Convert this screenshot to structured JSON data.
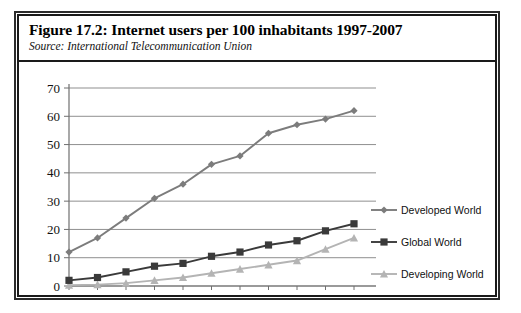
{
  "figure": {
    "title": "Figure 17.2:  Internet users per 100 inhabitants 1997-2007",
    "source": "Source:  International Telecommunication Union"
  },
  "chart_data": {
    "type": "line",
    "title": "Internet users per 100 inhabitants 1997-2007",
    "subtitle": "Source: International Telecommunication Union",
    "xlabel": "",
    "ylabel": "",
    "x": [
      1997,
      1998,
      1999,
      2000,
      2001,
      2002,
      2003,
      2004,
      2005,
      2006,
      2007
    ],
    "xtick_labels": [
      "1997",
      "",
      "1999",
      "",
      "2001",
      "",
      "2003",
      "",
      "2005",
      "",
      "2007"
    ],
    "xlim": [
      1997,
      2007
    ],
    "ylim": [
      0,
      70
    ],
    "yticks": [
      0,
      10,
      20,
      30,
      40,
      50,
      60,
      70
    ],
    "ytick_labels": [
      "0",
      "10",
      "20",
      "30",
      "40",
      "50",
      "60",
      "70"
    ],
    "grid": true,
    "grid_axis": "y",
    "legend_position": "right",
    "series": [
      {
        "name": "Developed World",
        "color": "#7c7c7c",
        "marker": "diamond",
        "values": [
          12,
          17,
          24,
          31,
          36,
          43,
          46,
          54,
          57,
          59,
          62
        ]
      },
      {
        "name": "Global World",
        "color": "#3a3a3a",
        "marker": "square",
        "values": [
          2,
          3,
          5,
          7,
          8,
          10.5,
          12,
          14.5,
          16,
          19.5,
          22
        ]
      },
      {
        "name": "Developing World",
        "color": "#b4b4b4",
        "marker": "triangle",
        "values": [
          0.3,
          0.5,
          1,
          2,
          3,
          4.5,
          6,
          7.5,
          9,
          13,
          17
        ]
      }
    ]
  },
  "legend": {
    "items": [
      {
        "label": "Developed World"
      },
      {
        "label": "Global World"
      },
      {
        "label": "Developing World"
      }
    ]
  },
  "colors": {
    "frame": "#1a1a1a",
    "grid": "#8f8f8f",
    "axis": "#6f6f6f",
    "background": "#ffffff"
  }
}
